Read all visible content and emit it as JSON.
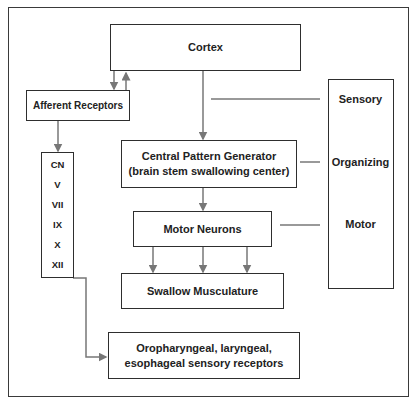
{
  "diagram": {
    "nodes": {
      "cortex": "Cortex",
      "afferent": "Afferent Receptors",
      "cpg_line1": "Central Pattern Generator",
      "cpg_line2": "(brain stem swallowing center)",
      "motor_neurons": "Motor Neurons",
      "swallow": "Swallow Musculature",
      "oro_line1": "Oropharyngeal, laryngeal,",
      "oro_line2": "esophageal sensory receptors"
    },
    "cranial_nerves": [
      "CN",
      "V",
      "VII",
      "IX",
      "X",
      "XII"
    ],
    "stages": [
      "Sensory",
      "Organizing",
      "Motor"
    ],
    "colors": {
      "box_border": "#2e2e2e",
      "arrow": "#777777",
      "text": "#222222"
    }
  }
}
